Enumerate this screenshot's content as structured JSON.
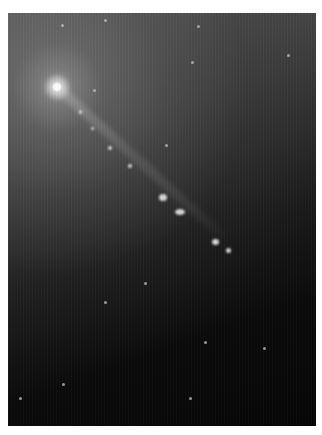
{
  "image": {
    "subject": "elliptical galaxy with bright core and relativistic jet",
    "description": "Grayscale astronomical photograph: bright galactic nucleus in upper-left emitting a narrow jet toward lower-right, with knots of emission, fading into a dark background sprinkled with faint stars",
    "colors": {
      "background_page": "#ffffff",
      "halo": "#8a8a8a",
      "sky_dark": "#050505",
      "core": "#ffffff"
    },
    "core": {
      "x": 57,
      "y": 87,
      "size": 10
    },
    "jet": {
      "x": 57,
      "y": 87,
      "length": 225,
      "angle_deg": 42
    },
    "knots": [
      {
        "x": 80,
        "y": 112,
        "w": 3,
        "h": 4
      },
      {
        "x": 92,
        "y": 128,
        "w": 3,
        "h": 3
      },
      {
        "x": 110,
        "y": 148,
        "w": 4,
        "h": 4
      },
      {
        "x": 130,
        "y": 166,
        "w": 4,
        "h": 4
      },
      {
        "x": 163,
        "y": 197,
        "w": 8,
        "h": 7
      },
      {
        "x": 180,
        "y": 212,
        "w": 10,
        "h": 6
      },
      {
        "x": 215,
        "y": 242,
        "w": 7,
        "h": 6
      },
      {
        "x": 228,
        "y": 250,
        "w": 5,
        "h": 5
      }
    ],
    "stars": [
      {
        "x": 62,
        "y": 25
      },
      {
        "x": 105,
        "y": 20
      },
      {
        "x": 198,
        "y": 26
      },
      {
        "x": 94,
        "y": 90
      },
      {
        "x": 192,
        "y": 62
      },
      {
        "x": 288,
        "y": 55
      },
      {
        "x": 166,
        "y": 145
      },
      {
        "x": 105,
        "y": 302
      },
      {
        "x": 264,
        "y": 348
      },
      {
        "x": 20,
        "y": 398
      },
      {
        "x": 63,
        "y": 384
      },
      {
        "x": 190,
        "y": 398
      },
      {
        "x": 205,
        "y": 342
      },
      {
        "x": 145,
        "y": 283
      }
    ]
  }
}
